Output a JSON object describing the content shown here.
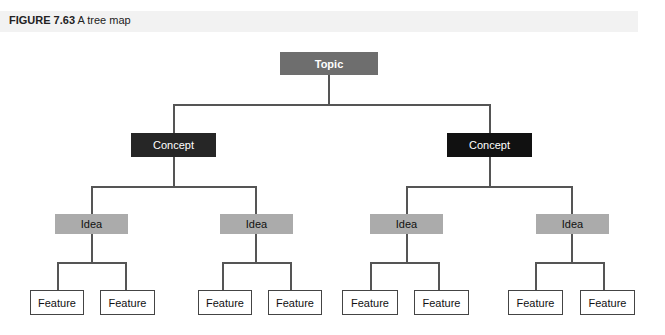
{
  "header": {
    "figure_label": "FIGURE 7.63",
    "title": "A tree map"
  },
  "tree": {
    "root": "Topic",
    "level1": [
      "Concept",
      "Concept"
    ],
    "level2": [
      "Idea",
      "Idea",
      "Idea",
      "Idea"
    ],
    "level3": [
      "Feature",
      "Feature",
      "Feature",
      "Feature",
      "Feature",
      "Feature",
      "Feature",
      "Feature"
    ]
  },
  "colors": {
    "topic": "#6e6e6e",
    "concept": "#262626",
    "idea": "#ababab",
    "feature_border": "#444444",
    "header_bg": "#f2f2f2"
  }
}
